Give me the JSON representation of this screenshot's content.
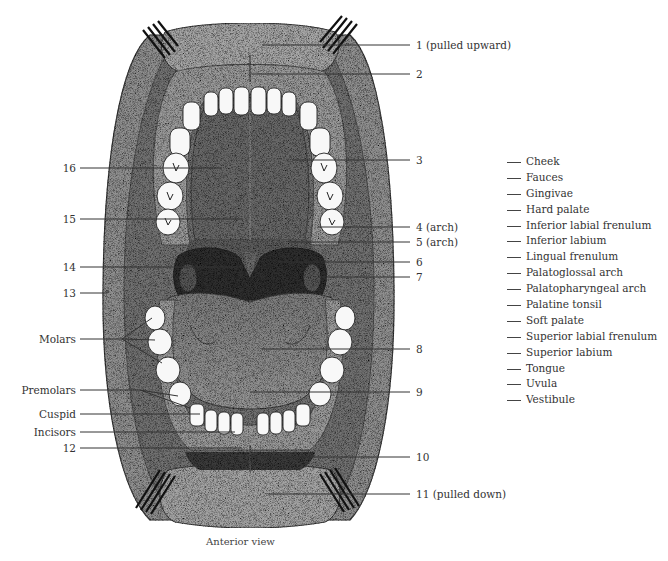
{
  "figure": {
    "view_caption": "Anterior view",
    "right_labels": [
      {
        "id": "1",
        "text": "1 (pulled upward)",
        "y": 45
      },
      {
        "id": "2",
        "text": "2",
        "y": 74
      },
      {
        "id": "3",
        "text": "3",
        "y": 160
      },
      {
        "id": "4",
        "text": "4 (arch)",
        "y": 227
      },
      {
        "id": "5",
        "text": "5 (arch)",
        "y": 242
      },
      {
        "id": "6",
        "text": "6",
        "y": 262
      },
      {
        "id": "7",
        "text": "7",
        "y": 277
      },
      {
        "id": "8",
        "text": "8",
        "y": 349
      },
      {
        "id": "9",
        "text": "9",
        "y": 392
      },
      {
        "id": "10",
        "text": "10",
        "y": 457
      },
      {
        "id": "11",
        "text": "11 (pulled down)",
        "y": 494
      }
    ],
    "left_labels": [
      {
        "id": "16",
        "text": "16",
        "y": 168
      },
      {
        "id": "15",
        "text": "15",
        "y": 219
      },
      {
        "id": "14",
        "text": "14",
        "y": 267
      },
      {
        "id": "13",
        "text": "13",
        "y": 293
      },
      {
        "id": "molars",
        "text": "Molars",
        "y": 339
      },
      {
        "id": "premolars",
        "text": "Premolars",
        "y": 390
      },
      {
        "id": "cuspid",
        "text": "Cuspid",
        "y": 414
      },
      {
        "id": "incisors",
        "text": "Incisors",
        "y": 432
      },
      {
        "id": "12",
        "text": "12",
        "y": 448
      }
    ]
  },
  "word_bank": {
    "terms": [
      "Cheek",
      "Fauces",
      "Gingivae",
      "Hard palate",
      "Inferior labial frenulum",
      "Inferior labium",
      "Lingual frenulum",
      "Palatoglossal arch",
      "Palatopharyngeal arch",
      "Palatine tonsil",
      "Soft palate",
      "Superior labial frenulum",
      "Superior labium",
      "Tongue",
      "Uvula",
      "Vestibule"
    ]
  },
  "colors": {
    "cheek_outer": "#8a8a8a",
    "cheek_inner": "#6f6f6f",
    "gum": "#9c9c9c",
    "palate": "#6a6a6a",
    "pharynx": "#2e2e2e",
    "tongue": "#8c8c8c",
    "tooth": "#f7f7f7",
    "lip": "#a8a8a8",
    "leader_line": "#333333"
  }
}
